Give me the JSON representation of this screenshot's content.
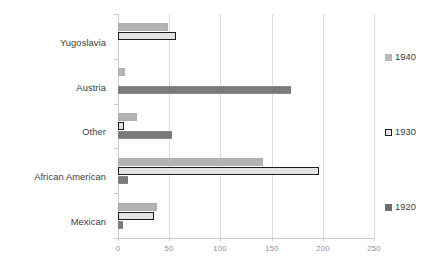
{
  "chart_data": {
    "type": "bar",
    "orientation": "horizontal",
    "title": "",
    "xlabel": "",
    "ylabel": "",
    "categories": [
      "Yugoslavia",
      "Austria",
      "Other",
      "African American",
      "Mexican"
    ],
    "series": [
      {
        "name": "1940",
        "color": "#b3b3b3",
        "values": [
          49,
          7,
          19,
          142,
          38
        ]
      },
      {
        "name": "1930",
        "color": "#ffffff",
        "border_color": "#1c1c1c",
        "values": [
          57,
          0,
          6,
          196,
          35
        ]
      },
      {
        "name": "1920",
        "color": "#7a7a7a",
        "values": [
          0,
          169,
          53,
          10,
          5
        ]
      }
    ],
    "xlim": [
      0,
      250
    ],
    "xticks": [
      0,
      50,
      100,
      150,
      200,
      250
    ],
    "xtick_labels": [
      "0",
      "50",
      "100",
      "150",
      "200",
      "250"
    ],
    "grid": true,
    "grid_axis": "x",
    "legend_position": "right",
    "legend_entries": [
      "1940",
      "1930",
      "1920"
    ]
  },
  "legend": {
    "items": [
      {
        "label": "1940"
      },
      {
        "label": "1930"
      },
      {
        "label": "1920"
      }
    ]
  }
}
